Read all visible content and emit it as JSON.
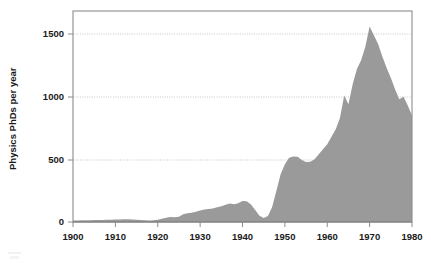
{
  "chart_data": {
    "type": "area",
    "title": "",
    "subtitle": "",
    "xlabel": "",
    "ylabel": "Physics PhDs per year",
    "xlim": [
      1900,
      1980
    ],
    "ylim": [
      0,
      1700
    ],
    "xticks": [
      1900,
      1910,
      1920,
      1930,
      1940,
      1950,
      1960,
      1970,
      1980
    ],
    "xtick_labels": [
      "1900",
      "1910",
      "1920",
      "1930",
      "1940",
      "1950",
      "1960",
      "1970",
      "1980"
    ],
    "yticks": [
      0,
      500,
      1000,
      1500
    ],
    "ytick_labels": [
      "0",
      "500",
      "1000",
      "1500"
    ],
    "grid": true,
    "grid_axis": "y",
    "legend": null,
    "legend_position": "none",
    "series_color": "#9a9a9a",
    "x": [
      1900,
      1901,
      1902,
      1903,
      1904,
      1905,
      1906,
      1907,
      1908,
      1909,
      1910,
      1911,
      1912,
      1913,
      1914,
      1915,
      1916,
      1917,
      1918,
      1919,
      1920,
      1921,
      1922,
      1923,
      1924,
      1925,
      1926,
      1927,
      1928,
      1929,
      1930,
      1931,
      1932,
      1933,
      1934,
      1935,
      1936,
      1937,
      1938,
      1939,
      1940,
      1941,
      1942,
      1943,
      1944,
      1945,
      1946,
      1947,
      1948,
      1949,
      1950,
      1951,
      1952,
      1953,
      1954,
      1955,
      1956,
      1957,
      1958,
      1959,
      1960,
      1961,
      1962,
      1963,
      1964,
      1965,
      1966,
      1967,
      1968,
      1969,
      1970,
      1971,
      1972,
      1973,
      1974,
      1975,
      1976,
      1977,
      1978,
      1979,
      1980
    ],
    "values": [
      12,
      12,
      13,
      14,
      14,
      15,
      16,
      16,
      17,
      18,
      20,
      20,
      22,
      22,
      20,
      18,
      16,
      14,
      12,
      14,
      18,
      26,
      34,
      40,
      38,
      42,
      62,
      70,
      74,
      82,
      92,
      100,
      104,
      108,
      118,
      126,
      138,
      148,
      142,
      150,
      168,
      166,
      140,
      96,
      50,
      32,
      48,
      120,
      250,
      380,
      460,
      512,
      522,
      520,
      495,
      478,
      480,
      500,
      540,
      580,
      620,
      680,
      740,
      830,
      1010,
      940,
      1100,
      1220,
      1290,
      1400,
      1560,
      1490,
      1420,
      1320,
      1230,
      1150,
      1060,
      980,
      1000,
      930,
      850
    ],
    "annotations": []
  },
  "axes": {
    "ylabel": "Physics PhDs per year"
  },
  "figure": {
    "background_color": "#ffffff",
    "plot_frame_color": "#8c8c8c",
    "gridline_color": "#b9b9b9",
    "fill_color": "#9a9a9a",
    "text_color": "#1a1a1a"
  }
}
